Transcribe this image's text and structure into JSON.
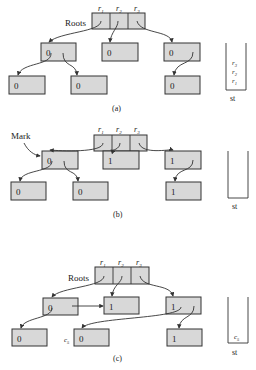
{
  "figure": {
    "panels": [
      {
        "caption": "(a)",
        "roots_label": "Roots",
        "root_labels": [
          "r",
          "r",
          "r"
        ],
        "root_subs": [
          "1",
          "2",
          "3"
        ],
        "nodes": {
          "a": "0",
          "b": "0",
          "c": "0",
          "d": "0",
          "e": "0",
          "f": "0"
        },
        "stack_label": "st",
        "stack_items": [
          {
            "sym": "r",
            "sub": "3"
          },
          {
            "sym": "r",
            "sub": "2"
          },
          {
            "sym": "r",
            "sub": "1"
          }
        ]
      },
      {
        "caption": "(b)",
        "mark_label": "Mark",
        "root_labels": [
          "r",
          "r",
          "r"
        ],
        "root_subs": [
          "1",
          "2",
          "3"
        ],
        "nodes": {
          "a": "0",
          "b": "1",
          "c": "1",
          "d": "0",
          "e": "0",
          "f": "1"
        },
        "stack_label": "st",
        "stack_items": []
      },
      {
        "caption": "(c)",
        "roots_label": "Roots",
        "root_labels": [
          "r",
          "r",
          "r"
        ],
        "root_subs": [
          "1",
          "2",
          "3"
        ],
        "nodes": {
          "a": "0",
          "b": "1",
          "c": "1",
          "d": "0",
          "e": "0",
          "f": "1"
        },
        "node_e_label": {
          "sym": "c",
          "sub": "5"
        },
        "stack_label": "st",
        "stack_items": [
          {
            "sym": "c",
            "sub": "5"
          }
        ]
      }
    ]
  }
}
